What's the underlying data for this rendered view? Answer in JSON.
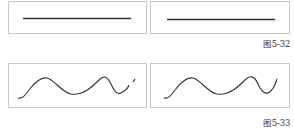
{
  "figures": [
    {
      "caption": "图5-32",
      "panels": [
        {
          "name": "straight-line-stroke-left",
          "shape": "straight-line"
        },
        {
          "name": "straight-line-stroke-right",
          "shape": "straight-line"
        }
      ]
    },
    {
      "caption": "图5-33",
      "panels": [
        {
          "name": "wavy-stroke-broken",
          "shape": "wave-with-gap"
        },
        {
          "name": "wavy-stroke-smooth",
          "shape": "wave-continuous"
        }
      ]
    }
  ],
  "colors": {
    "border": "#c8c8c8",
    "stroke": "#333333",
    "caption": "#333333"
  }
}
